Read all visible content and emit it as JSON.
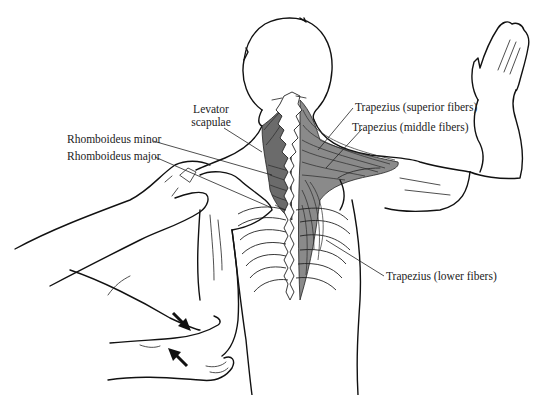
{
  "figure": {
    "labels": {
      "levator_scapulae_line1": "Levator",
      "levator_scapulae_line2": "scapulae",
      "rhomboideus_minor": "Rhomboideus minor",
      "rhomboideus_major": "Rhomboideus major",
      "trapezius_superior": "Trapezius (superior fibers)",
      "trapezius_middle": "Trapezius (middle fibers)",
      "trapezius_lower": "Trapezius (lower fibers)"
    },
    "arrows": [
      {
        "name": "arrow-down-right",
        "direction": "down-right"
      },
      {
        "name": "arrow-up-left",
        "direction": "up-left"
      }
    ],
    "colors": {
      "line": "#111111",
      "muscle_fill": "#8a8a8a",
      "background": "#ffffff"
    }
  }
}
